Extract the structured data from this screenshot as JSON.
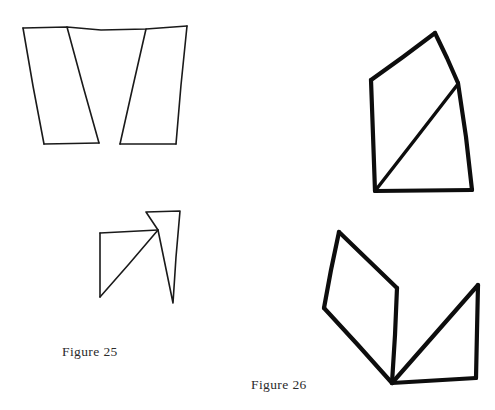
{
  "page": {
    "background_color": "#ffffff",
    "width": 495,
    "height": 410
  },
  "captions": [
    {
      "id": "figure-25",
      "text": "Figure 25"
    },
    {
      "id": "figure-26",
      "text": "Figure 26"
    }
  ],
  "figures": [
    {
      "id": "figure-25",
      "label": "Figure 25",
      "style": "thin-line hand-drawn outline",
      "stroke_color": "#1a1a1a",
      "stroke_width": 1.6,
      "shapes": [
        {
          "name": "upper-left-double-trapezoid",
          "description": "Two mirrored trapezoids sharing a top edge whose inner slanted sides cross in an X near the middle",
          "paths": [
            "M 23,28 L 187,26 L 176,144 L 120,144 L 146,29",
            "M 23,28 L 44,144 L 99,143 L 67,27",
            "M 67,27 L 176,144",
            "M 146,29 L 44,144"
          ],
          "crossing_point": [
            105,
            93
          ]
        },
        {
          "name": "lower-left-quad-and-triangle",
          "description": "A small quadrilateral on the left joined at a shared vertex to a narrow triangle on the right, with a diagonal from the shared vertex to the quad's bottom corner",
          "paths": [
            "M 100,233 L 158,230 L 100,297 Z",
            "M 100,233 L 100,297",
            "M 158,230 L 146,212 L 180,211 L 173,303 Z",
            "M 158,230 L 100,297"
          ]
        }
      ]
    },
    {
      "id": "figure-26",
      "label": "Figure 26",
      "style": "thick-line hand-drawn outline",
      "stroke_color": "#0d0d0d",
      "stroke_width": 4.2,
      "shapes": [
        {
          "name": "upper-right-pentagon-with-diagonal",
          "description": "A five-sided closed figure, roughly a tall quadrilateral with a peaked top, crossed by a long diagonal from the lower-left corner up to the right-side vertex",
          "paths": [
            "M 371,80 L 435,33 L 458,83 L 472,190 L 375,191 Z",
            "M 375,191 L 458,84"
          ]
        },
        {
          "name": "lower-right-quad-and-triangle",
          "description": "A tilted parallelogram-like quadrilateral on the left meeting a right triangle on the right, both converging at a common bottom apex",
          "paths": [
            "M 339,232 L 397,288 L 392,383 L 324,308 Z",
            "M 392,383 L 478,285 L 476,378 Z"
          ],
          "shared_apex": [
            392,
            383
          ]
        }
      ]
    }
  ]
}
